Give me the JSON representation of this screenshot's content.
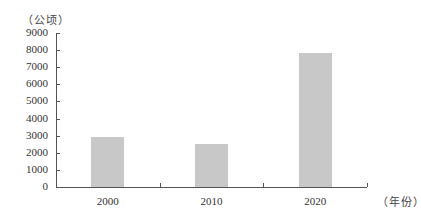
{
  "chart_data": {
    "type": "bar",
    "title": "",
    "xlabel": "（年份）",
    "ylabel": "（公顷）",
    "categories": [
      "2000",
      "2010",
      "2020"
    ],
    "values": [
      2900,
      2500,
      7850
    ],
    "ylim": [
      0,
      9000
    ],
    "yticks": [
      0,
      1000,
      2000,
      3000,
      4000,
      5000,
      6000,
      7000,
      8000,
      9000
    ],
    "grid": false,
    "legend": null,
    "bar_color": "#c8c8c8"
  },
  "labels": {
    "y_unit": "（公顷）",
    "x_unit": "（年份）",
    "yticks": [
      "0",
      "1000",
      "2000",
      "3000",
      "4000",
      "5000",
      "6000",
      "7000",
      "8000",
      "9000"
    ],
    "xticks": [
      "2000",
      "2010",
      "2020"
    ]
  }
}
